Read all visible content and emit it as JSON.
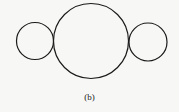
{
  "figure": {
    "caption": "(b)",
    "stroke_color": "#1a1a1a",
    "shapes": [
      {
        "name": "left-small-circle",
        "kind": "circle"
      },
      {
        "name": "center-large-circle",
        "kind": "circle"
      },
      {
        "name": "right-small-circle",
        "kind": "circle"
      }
    ]
  }
}
